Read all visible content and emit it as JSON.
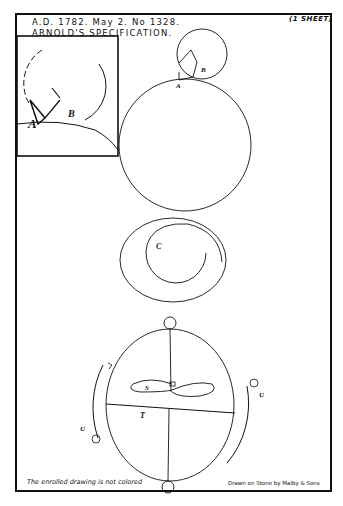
{
  "header": {
    "line1": "A.D. 1782. May 2. No 1328.",
    "line2": "ARNOLD'S SPECIFICATION.",
    "sheet_count": "(1 SHEET)"
  },
  "figures": {
    "inset_labels": {
      "a": "A",
      "b": "B"
    },
    "top_labels": {
      "a": "A",
      "b": "B"
    },
    "spiral_label": "C",
    "balance_labels": {
      "s": "S",
      "t": "T",
      "u_right": "U",
      "u_left": "U"
    }
  },
  "footer": {
    "note": "The enrolled drawing is not colored",
    "credit": "Drawn on Stone by Malby & Sons"
  },
  "colors": {
    "ink": "#111111",
    "paper": "#ffffff"
  }
}
